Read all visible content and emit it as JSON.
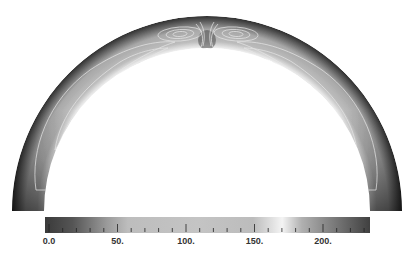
{
  "chart_data": {
    "type": "heatmap",
    "title": "",
    "domain": {
      "shape": "semi-annulus",
      "center_px": [
        207,
        211
      ],
      "outer_radius_px": 195,
      "inner_radius_px": 163
    },
    "colorbar": {
      "orientation": "horizontal",
      "range": [
        0,
        235
      ],
      "ticks": [
        0,
        50,
        100,
        150,
        200
      ],
      "tick_labels": [
        "0.0",
        "50.",
        "100.",
        "150.",
        "200."
      ],
      "minor_tick_step": 10,
      "colormap_stops": [
        {
          "value": 0,
          "color": "#3a3a3a"
        },
        {
          "value": 20,
          "color": "#555555"
        },
        {
          "value": 45,
          "color": "#9a9a9a"
        },
        {
          "value": 60,
          "color": "#bdbdbd"
        },
        {
          "value": 110,
          "color": "#c4c4c4"
        },
        {
          "value": 150,
          "color": "#bcbcbc"
        },
        {
          "value": 172,
          "color": "#f4f4f4"
        },
        {
          "value": 185,
          "color": "#b0b0b0"
        },
        {
          "value": 210,
          "color": "#7a7a7a"
        },
        {
          "value": 235,
          "color": "#404040"
        }
      ]
    },
    "field_profile": {
      "outer_wall_value": 10,
      "inner_wall_value": 175,
      "core_value": 110,
      "legs_value": 20
    },
    "streamlines": {
      "color": "#e6e6e6",
      "apex_cells": 2,
      "flank_cells": 2
    }
  }
}
